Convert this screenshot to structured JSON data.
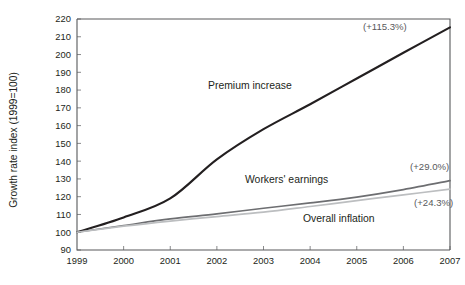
{
  "chart_data": {
    "type": "line",
    "title": "",
    "xlabel": "",
    "ylabel": "Growth rate index (1999=100)",
    "x": [
      1999,
      2000,
      2001,
      2002,
      2003,
      2004,
      2005,
      2006,
      2007
    ],
    "xtick_labels": [
      "1999",
      "2000",
      "2001",
      "2002",
      "2003",
      "2004",
      "2005",
      "2006",
      "2007"
    ],
    "xlim": [
      1999,
      2007
    ],
    "ylim": [
      90,
      220
    ],
    "ytick_labels": [
      "90",
      "100",
      "110",
      "120",
      "130",
      "140",
      "150",
      "160",
      "170",
      "180",
      "190",
      "200",
      "210",
      "220"
    ],
    "yticks": [
      90,
      100,
      110,
      120,
      130,
      140,
      150,
      160,
      170,
      180,
      190,
      200,
      210,
      220
    ],
    "grid": false,
    "legend_position": "inline-labels",
    "series": [
      {
        "name": "Premium increase",
        "color": "#231f20",
        "values": [
          100.0,
          108.3,
          119.0,
          141.0,
          158.0,
          172.0,
          186.5,
          201.0,
          215.3
        ],
        "end_annotation": "(+115.3%)"
      },
      {
        "name": "Workers' earnings",
        "color": "#6d6e71",
        "values": [
          100.0,
          103.8,
          107.5,
          110.3,
          113.5,
          116.5,
          119.8,
          124.0,
          129.0
        ],
        "end_annotation": "(+29.0%)"
      },
      {
        "name": "Overall inflation",
        "color": "#bcbec0",
        "values": [
          100.0,
          103.4,
          106.3,
          108.8,
          111.3,
          114.5,
          117.8,
          121.0,
          124.3
        ],
        "end_annotation": "(+24.3%)"
      }
    ],
    "inline_labels": [
      {
        "text": "Premium increase",
        "x_px": 208,
        "y_px": 89
      },
      {
        "text": "Workers' earnings",
        "x_px": 245,
        "y_px": 183
      },
      {
        "text": "Overall inflation",
        "x_px": 303,
        "y_px": 222
      }
    ],
    "annotations": [
      {
        "text": "(+115.3%)",
        "x_px": 363,
        "y_px": 30
      },
      {
        "text": "(+29.0%)",
        "x_px": 410,
        "y_px": 170
      },
      {
        "text": "(+24.3%)",
        "x_px": 414,
        "y_px": 206
      }
    ]
  }
}
